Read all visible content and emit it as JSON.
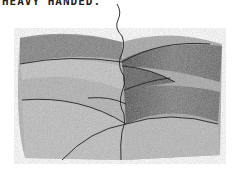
{
  "caption": "HEAVY HANDED.",
  "illustration": {
    "subject": "pencil-sketch-overlapping-curved-layers",
    "description": "Graphite pencil drawing of stacked curved bands divided by a wavy vertical line, with heavier shading on right side",
    "colors": {
      "paper": "#ffffff",
      "graphite_dark": "#2a2a2a",
      "graphite_mid": "#8a8a8a",
      "graphite_light": "#c8c8c8"
    }
  }
}
